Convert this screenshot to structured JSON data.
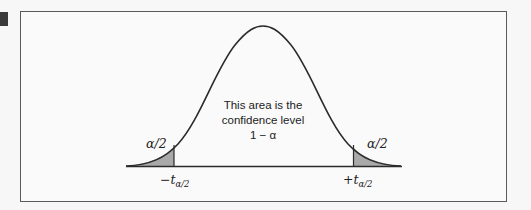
{
  "figure": {
    "type": "t-distribution confidence interval diagram",
    "center_label": {
      "line1": "This area is the",
      "line2": "confidence level",
      "line3": "1 − α"
    },
    "left_tail_label": "α/2",
    "right_tail_label": "α/2",
    "left_critical_value": {
      "sign": "−",
      "symbol": "t",
      "subscript": "α/2"
    },
    "right_critical_value": {
      "sign": "+",
      "symbol": "t",
      "subscript": "α/2"
    },
    "colors": {
      "curve": "#2b2b2b",
      "tail_fill": "#a9a9a9",
      "frame_border": "#5a5a5a",
      "background": "#fafafa"
    }
  }
}
